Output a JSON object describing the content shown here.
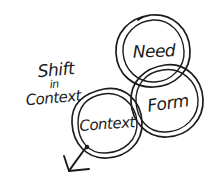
{
  "diagram": {
    "background_color": "#ffffff",
    "ink_color": "#1b1b1b",
    "annotation": {
      "line1": "Shift",
      "line2": "in",
      "line3": "Context"
    },
    "circles": [
      {
        "name": "need",
        "label": "Need"
      },
      {
        "name": "form",
        "label": "Form"
      },
      {
        "name": "context",
        "label": "Context"
      }
    ],
    "arrow": {
      "icon": "arrow-down-left-icon",
      "direction": "down-left"
    }
  }
}
